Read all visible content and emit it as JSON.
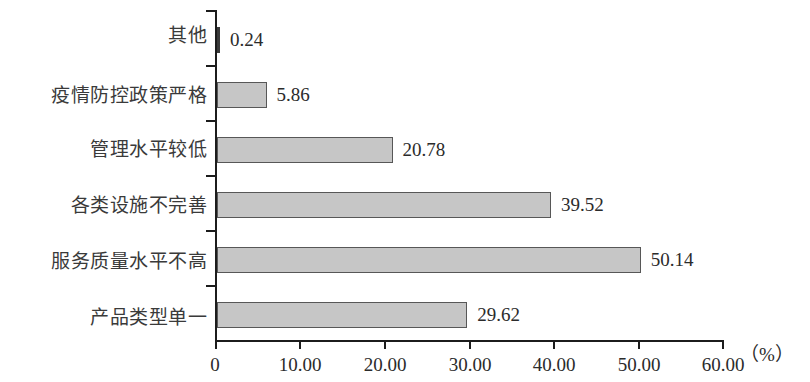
{
  "chart_data": {
    "type": "bar",
    "orientation": "horizontal",
    "title": "",
    "subtitle": "",
    "xlabel": "（%）",
    "ylabel": "",
    "xlim": [
      0,
      60
    ],
    "grid": false,
    "legend": null,
    "categories": [
      "其他",
      "疫情防控政策严格",
      "管理水平较低",
      "各类设施不完善",
      "服务质量水平不高",
      "产品类型单一"
    ],
    "values": [
      0.24,
      5.86,
      20.78,
      39.52,
      50.14,
      29.62
    ],
    "value_labels": [
      "0.24",
      "5.86",
      "20.78",
      "39.52",
      "50.14",
      "29.62"
    ],
    "xticks": [
      0,
      10,
      20,
      30,
      40,
      50,
      60
    ],
    "xtick_labels": [
      "0",
      "10.00",
      "20.00",
      "30.00",
      "40.00",
      "50.00",
      "60.00"
    ],
    "unit_suffix": "（%）",
    "bar_fill_color": "#c6c6c6",
    "bar_border_color": "#575757",
    "axis_color": "#1c1c1c",
    "text_color": "#2b2b2b",
    "background_color": "#ffffff"
  }
}
